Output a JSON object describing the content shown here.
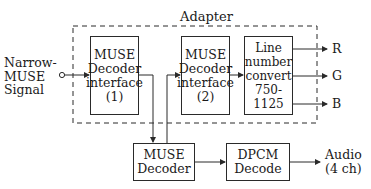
{
  "diagram": {
    "group_label": "Adapter",
    "input": {
      "lines": [
        "Narrow-",
        "MUSE",
        "Signal"
      ]
    },
    "blocks": [
      {
        "id": "interface1",
        "lines": [
          "MUSE",
          "Decoder",
          "interface",
          "(1)"
        ]
      },
      {
        "id": "interface2",
        "lines": [
          "MUSE",
          "Decoder",
          "interface",
          "(2)"
        ]
      },
      {
        "id": "line_convert",
        "lines": [
          "Line",
          "number",
          "convert",
          "750-1125"
        ]
      },
      {
        "id": "muse_decoder",
        "lines": [
          "MUSE",
          "Decoder"
        ]
      },
      {
        "id": "dpcm_decode",
        "lines": [
          "DPCM",
          "Decode"
        ]
      }
    ],
    "outputs": {
      "r": "R",
      "g": "G",
      "b": "B",
      "audio": [
        "Audio",
        "(4 ch)"
      ]
    },
    "edges": [
      [
        "input",
        "interface1"
      ],
      [
        "interface1",
        "muse_decoder"
      ],
      [
        "muse_decoder",
        "interface2"
      ],
      [
        "interface2",
        "line_convert"
      ],
      [
        "line_convert",
        "R"
      ],
      [
        "line_convert",
        "G"
      ],
      [
        "line_convert",
        "B"
      ],
      [
        "muse_decoder",
        "dpcm_decode"
      ],
      [
        "dpcm_decode",
        "audio"
      ]
    ]
  }
}
